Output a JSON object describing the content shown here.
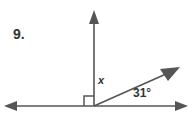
{
  "figure": {
    "problem_number": "9.",
    "unknown_angle_label": "x",
    "known_angle_label": "31°",
    "known_angle_value": 31,
    "unknown_angle_value": 59,
    "stroke_color": "#555555",
    "text_color": "#333333",
    "background_color": "#ffffff",
    "icons": {
      "left_arrow": "arrow-left-icon",
      "right_arrow": "arrow-right-icon",
      "up_arrow": "arrow-up-icon",
      "diagonal_arrow": "arrow-up-right-icon",
      "right_angle": "right-angle-mark-icon"
    }
  },
  "geometry": {
    "vertex": {
      "x": 94,
      "y": 106
    },
    "baseline_y": 106,
    "baseline_left_x": 6,
    "baseline_right_x": 186,
    "vertical_top_y": 14,
    "diagonal_end": {
      "x": 174,
      "y": 71
    },
    "right_angle_size": 10
  }
}
